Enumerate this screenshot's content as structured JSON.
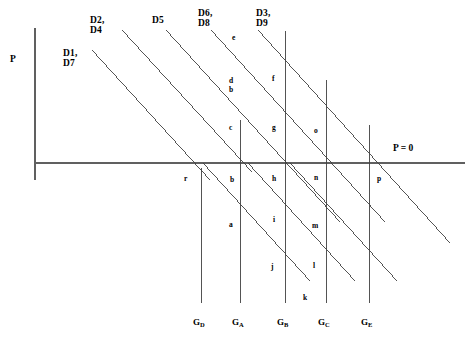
{
  "figure": {
    "type": "economics-demand-curve-diagram",
    "background": "#ffffff",
    "line_color": "#404040",
    "axis_color": "#606060",
    "width": 473,
    "height": 340
  },
  "axes": {
    "vertical_axis_label": "P",
    "horizontal_axis_label": "P = 0",
    "vertical_axis_x": 35,
    "horizontal_axis_y": 163,
    "horizontal_axis_x_start": 35,
    "horizontal_axis_x_end": 465,
    "vertical_axis_y_top": 28,
    "vertical_axis_y_bottom": 180
  },
  "demand_labels": [
    {
      "id": "d1d7",
      "lines": [
        "D1,",
        "D7"
      ],
      "x": 63,
      "y": 48
    },
    {
      "id": "d2d4",
      "lines": [
        "D2,",
        "D4"
      ],
      "x": 90,
      "y": 15
    },
    {
      "id": "d5",
      "lines": [
        "D5"
      ],
      "x": 152,
      "y": 15
    },
    {
      "id": "d6d8",
      "lines": [
        "D6,",
        "D8"
      ],
      "x": 198,
      "y": 8
    },
    {
      "id": "d3d9",
      "lines": [
        "D3,",
        "D9"
      ],
      "x": 256,
      "y": 8
    }
  ],
  "demand_curves": [
    {
      "id": "curve-d1d7",
      "x1": 92,
      "y1": 50,
      "x2": 210,
      "y2": 180
    },
    {
      "id": "curve-d2d4",
      "x1": 122,
      "y1": 30,
      "x2": 252,
      "y2": 172
    },
    {
      "id": "curve-d5",
      "x1": 166,
      "y1": 30,
      "x2": 340,
      "y2": 222
    },
    {
      "id": "curve-d6d8",
      "x1": 211,
      "y1": 30,
      "x2": 385,
      "y2": 222
    },
    {
      "id": "curve-d3d9",
      "x1": 258,
      "y1": 30,
      "x2": 450,
      "y2": 243
    },
    {
      "id": "curve-lower-a",
      "x1": 203,
      "y1": 163,
      "x2": 310,
      "y2": 281
    },
    {
      "id": "curve-lower-b",
      "x1": 248,
      "y1": 163,
      "x2": 355,
      "y2": 281
    },
    {
      "id": "curve-lower-c",
      "x1": 290,
      "y1": 163,
      "x2": 397,
      "y2": 281
    }
  ],
  "vertical_lines": [
    {
      "id": "vline-gd",
      "x": 201,
      "y_top": 168,
      "y_bottom": 303
    },
    {
      "id": "vline-ga",
      "x": 240,
      "y_top": 120,
      "y_bottom": 303
    },
    {
      "id": "vline-gb",
      "x": 285,
      "y_top": 31,
      "y_bottom": 303
    },
    {
      "id": "vline-gc",
      "x": 326,
      "y_top": 80,
      "y_bottom": 303
    },
    {
      "id": "vline-ge",
      "x": 369,
      "y_top": 125,
      "y_bottom": 303
    }
  ],
  "area_letters": [
    {
      "id": "area-e",
      "text": "e",
      "x": 232,
      "y": 34
    },
    {
      "id": "area-d",
      "text": "d",
      "x": 229,
      "y": 77
    },
    {
      "id": "area-b-upper",
      "text": "b",
      "x": 229,
      "y": 86
    },
    {
      "id": "area-f",
      "text": "f",
      "x": 272,
      "y": 75
    },
    {
      "id": "area-c",
      "text": "c",
      "x": 229,
      "y": 124
    },
    {
      "id": "area-g",
      "text": "g",
      "x": 272,
      "y": 124
    },
    {
      "id": "area-o",
      "text": "o",
      "x": 314,
      "y": 127
    },
    {
      "id": "area-r",
      "text": "r",
      "x": 184,
      "y": 175
    },
    {
      "id": "area-b-lower",
      "text": "b",
      "x": 230,
      "y": 176
    },
    {
      "id": "area-h",
      "text": "h",
      "x": 272,
      "y": 175
    },
    {
      "id": "area-n",
      "text": "n",
      "x": 314,
      "y": 174
    },
    {
      "id": "area-p",
      "text": "p",
      "x": 377,
      "y": 175
    },
    {
      "id": "area-a",
      "text": "a",
      "x": 229,
      "y": 221
    },
    {
      "id": "area-i",
      "text": "i",
      "x": 273,
      "y": 216
    },
    {
      "id": "area-m",
      "text": "m",
      "x": 312,
      "y": 222
    },
    {
      "id": "area-j",
      "text": "j",
      "x": 271,
      "y": 263
    },
    {
      "id": "area-l",
      "text": "l",
      "x": 313,
      "y": 262
    },
    {
      "id": "area-k",
      "text": "k",
      "x": 303,
      "y": 294
    }
  ],
  "quantity_labels": [
    {
      "id": "q-gd",
      "base": "G",
      "sub": "D",
      "x": 193,
      "y": 318
    },
    {
      "id": "q-ga",
      "base": "G",
      "sub": "A",
      "x": 232,
      "y": 318
    },
    {
      "id": "q-gb",
      "base": "G",
      "sub": "B",
      "x": 277,
      "y": 318
    },
    {
      "id": "q-gc",
      "base": "G",
      "sub": "C",
      "x": 318,
      "y": 318
    },
    {
      "id": "q-ge",
      "base": "G",
      "sub": "E",
      "x": 361,
      "y": 318
    }
  ],
  "axis_label_positions": {
    "p_x": 10,
    "p_y": 54,
    "p_zero_x": 393,
    "p_zero_y": 143
  }
}
